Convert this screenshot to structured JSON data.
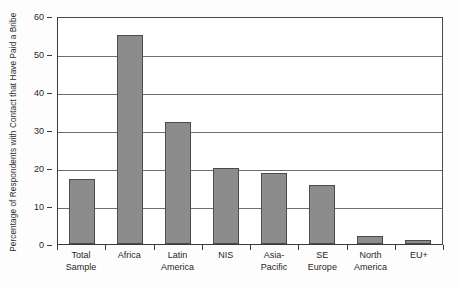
{
  "chart_data": {
    "type": "bar",
    "title": "",
    "xlabel": "",
    "ylabel": "Percentage of Respondents with Contact that Have Paid a Bribe",
    "ylabel_line1": "Percentage of Respondents with",
    "ylabel_line2": "Contact that Have Paid a Bribe",
    "categories": [
      "Total Sample",
      "Africa",
      "Latin America",
      "NIS",
      "Asia-Pacific",
      "SE Europe",
      "North America",
      "EU+"
    ],
    "category_lines": [
      [
        "Total",
        "Sample"
      ],
      [
        "Africa"
      ],
      [
        "Latin",
        "America"
      ],
      [
        "NIS"
      ],
      [
        "Asia-",
        "Pacific"
      ],
      [
        "SE",
        "Europe"
      ],
      [
        "North",
        "America"
      ],
      [
        "EU+"
      ]
    ],
    "values": [
      17,
      55,
      32,
      20,
      18.7,
      15.5,
      2,
      1
    ],
    "ylim": [
      0,
      60
    ],
    "yticks": [
      0,
      10,
      20,
      30,
      40,
      50,
      60
    ],
    "ytick_labels": [
      "0",
      "10",
      "20",
      "30",
      "40",
      "50",
      "60"
    ],
    "grid": true,
    "legend": "none",
    "bar_fill_color": "#8c8c8c",
    "bar_border_color": "#4c4c4c",
    "gridline_color": "#6e6e6e",
    "axis_color": "#3a3a3a",
    "background_color": "#ffffff"
  }
}
